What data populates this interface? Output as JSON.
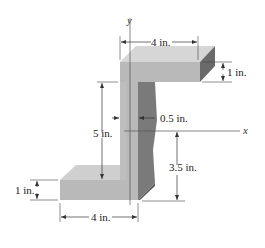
{
  "figure": {
    "axes": {
      "y_label": "y",
      "x_label": "x"
    },
    "dimensions": {
      "top_flange_width": "4 in.",
      "top_flange_thickness": "1 in.",
      "web_thickness": "0.5 in.",
      "web_height_left": "5 in.",
      "x_axis_to_bottom": "3.5 in.",
      "bottom_flange_thickness": "1 in.",
      "bottom_flange_width": "4 in."
    },
    "colors": {
      "front_face": "#b8b8b8",
      "top_face": "#d4d4d4",
      "side_face": "#6e6e6e",
      "web_shadow": "#8a8a8a"
    }
  }
}
